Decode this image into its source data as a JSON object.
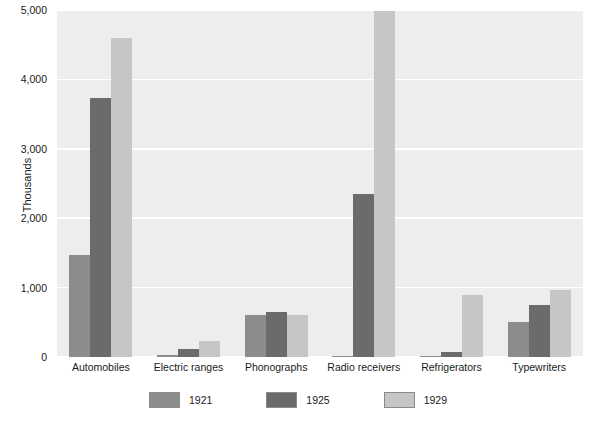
{
  "chart_data": {
    "type": "bar",
    "title": "",
    "xlabel": "",
    "ylabel": "Thousands",
    "ylim": [
      0,
      5000
    ],
    "yticks": [
      0,
      1000,
      2000,
      3000,
      4000,
      5000
    ],
    "ytick_labels": [
      "0",
      "1,000",
      "2,000",
      "3,000",
      "4,000",
      "5,000"
    ],
    "grid": true,
    "legend_position": "bottom",
    "categories": [
      "Automobiles",
      "Electric ranges",
      "Phonographs",
      "Radio receivers",
      "Refrigerators",
      "Typewriters"
    ],
    "series": [
      {
        "name": "1921",
        "color": "#8c8c8c",
        "values": [
          1470,
          35,
          600,
          12,
          5,
          500
        ]
      },
      {
        "name": "1925",
        "color": "#6b6b6b",
        "values": [
          3735,
          115,
          650,
          2350,
          75,
          750
        ]
      },
      {
        "name": "1929",
        "color": "#c6c6c6",
        "values": [
          4590,
          225,
          600,
          4980,
          890,
          960
        ]
      }
    ],
    "plot_background": "#eceded",
    "gridline_color": "#ffffff",
    "text_color": "#1a1a1a"
  }
}
